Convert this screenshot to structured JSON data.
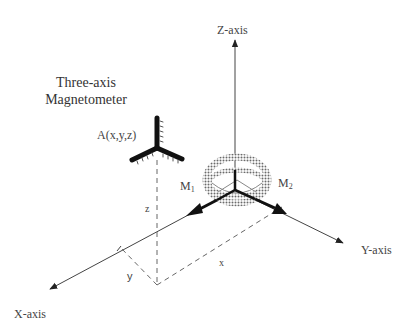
{
  "diagram": {
    "title_line1": "Three-axis",
    "title_line2": "Magnetometer",
    "sensor_label": "A(x,y,z)",
    "axes": {
      "z": "Z-axis",
      "x": "X-axis",
      "y": "Y-axis"
    },
    "magnets": {
      "m1": "M",
      "m1_sub": "1",
      "m2": "M",
      "m2_sub": "2"
    },
    "coordinate_labels": {
      "x": "x",
      "y": "y",
      "z": "z"
    },
    "colors": {
      "line": "#333333",
      "dashed": "#666666",
      "sphere_hatch": "#777777"
    }
  }
}
